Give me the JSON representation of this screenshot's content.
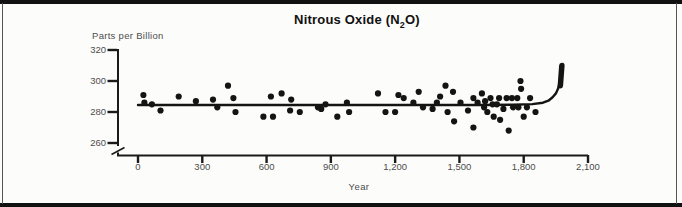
{
  "title": {
    "prefix": "Nitrous Oxide (N",
    "sub": "2",
    "suffix": "O)"
  },
  "frame": {
    "border_color": "#111111",
    "background": "#fcfcfa"
  },
  "chart_data": {
    "type": "scatter",
    "title": "Nitrous Oxide (N2O)",
    "xlabel": "Year",
    "ylabel": "Parts per Billion",
    "xlim": [
      0,
      2100
    ],
    "ylim": [
      260,
      320
    ],
    "axis_break_below_y": 260,
    "grid": false,
    "legend": false,
    "point_color": "#141414",
    "line_color": "#141414",
    "axis_color": "#1a1a1a",
    "label_color": "#4d4d4d",
    "x_ticks": {
      "values": [
        0,
        300,
        600,
        900,
        1200,
        1500,
        1800,
        2100
      ],
      "labels": [
        "0",
        "300",
        "600",
        "900",
        "1,200",
        "1,500",
        "1,800",
        "2,100"
      ]
    },
    "y_ticks": {
      "values": [
        320,
        300,
        280,
        260
      ],
      "labels": [
        "320",
        "300",
        "280",
        "260"
      ]
    },
    "points": [
      [
        25,
        291
      ],
      [
        30,
        286
      ],
      [
        65,
        285
      ],
      [
        105,
        281
      ],
      [
        190,
        290
      ],
      [
        270,
        287
      ],
      [
        350,
        288
      ],
      [
        370,
        283
      ],
      [
        420,
        297
      ],
      [
        445,
        289
      ],
      [
        455,
        280
      ],
      [
        585,
        277
      ],
      [
        620,
        290
      ],
      [
        630,
        277
      ],
      [
        670,
        292
      ],
      [
        710,
        281
      ],
      [
        715,
        288
      ],
      [
        755,
        280
      ],
      [
        840,
        283
      ],
      [
        855,
        282
      ],
      [
        875,
        285
      ],
      [
        930,
        277
      ],
      [
        975,
        286
      ],
      [
        985,
        280
      ],
      [
        1120,
        292
      ],
      [
        1155,
        280
      ],
      [
        1200,
        280
      ],
      [
        1215,
        291
      ],
      [
        1240,
        289
      ],
      [
        1285,
        286
      ],
      [
        1310,
        293
      ],
      [
        1330,
        283
      ],
      [
        1375,
        282
      ],
      [
        1395,
        286
      ],
      [
        1410,
        290
      ],
      [
        1435,
        297
      ],
      [
        1445,
        280
      ],
      [
        1470,
        293
      ],
      [
        1475,
        274
      ],
      [
        1505,
        286
      ],
      [
        1540,
        281
      ],
      [
        1565,
        289
      ],
      [
        1565,
        270
      ],
      [
        1585,
        286
      ],
      [
        1605,
        292
      ],
      [
        1615,
        283
      ],
      [
        1620,
        287
      ],
      [
        1630,
        280
      ],
      [
        1645,
        289
      ],
      [
        1655,
        285
      ],
      [
        1660,
        277
      ],
      [
        1675,
        285
      ],
      [
        1685,
        289
      ],
      [
        1690,
        275
      ],
      [
        1705,
        282
      ],
      [
        1720,
        289
      ],
      [
        1730,
        268
      ],
      [
        1745,
        289
      ],
      [
        1750,
        283
      ],
      [
        1770,
        289
      ],
      [
        1775,
        283
      ],
      [
        1785,
        300
      ],
      [
        1788,
        295
      ],
      [
        1800,
        277
      ],
      [
        1815,
        283
      ],
      [
        1830,
        289
      ],
      [
        1855,
        280
      ]
    ],
    "trend_line": [
      [
        0,
        284.5
      ],
      [
        800,
        284.5
      ],
      [
        1600,
        284.5
      ],
      [
        1750,
        284.7
      ],
      [
        1840,
        285.1
      ],
      [
        1890,
        286.0
      ],
      [
        1915,
        287.3
      ],
      [
        1935,
        289.5
      ],
      [
        1950,
        292.0
      ],
      [
        1960,
        295.0
      ],
      [
        1968,
        299.0
      ],
      [
        1973,
        303.0
      ],
      [
        1977,
        308.0
      ],
      [
        1979,
        310.5
      ]
    ],
    "trend_end_marker": {
      "from": [
        1971,
        297
      ],
      "to": [
        1978,
        310
      ]
    }
  }
}
